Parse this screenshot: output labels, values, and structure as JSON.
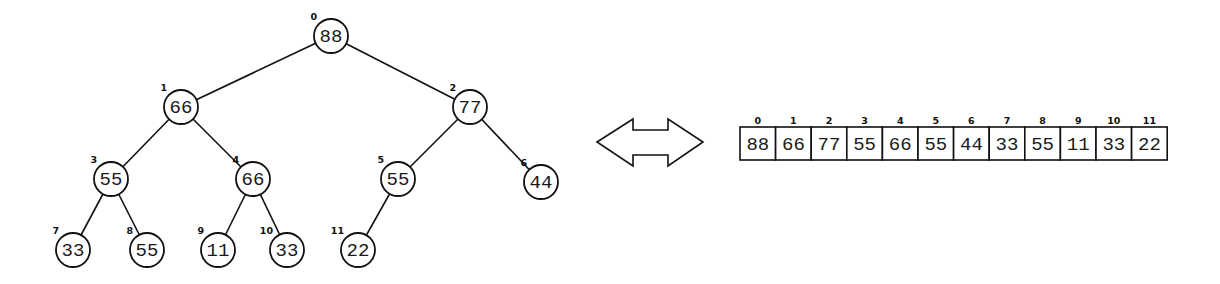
{
  "diagram": {
    "type": "max-heap tree-to-array equivalence",
    "colors": {
      "stroke": "#111111",
      "fill": "#ffffff",
      "text": "#1a1a1a"
    },
    "tree": {
      "node_radius": 17,
      "nodes": [
        {
          "index": "0",
          "value": "88",
          "x": 331,
          "y": 36
        },
        {
          "index": "1",
          "value": "66",
          "x": 181,
          "y": 107
        },
        {
          "index": "2",
          "value": "77",
          "x": 470,
          "y": 107
        },
        {
          "index": "3",
          "value": "55",
          "x": 111,
          "y": 179
        },
        {
          "index": "4",
          "value": "66",
          "x": 253,
          "y": 179
        },
        {
          "index": "5",
          "value": "55",
          "x": 398,
          "y": 179
        },
        {
          "index": "6",
          "value": "44",
          "x": 541,
          "y": 182
        },
        {
          "index": "7",
          "value": "33",
          "x": 73,
          "y": 250
        },
        {
          "index": "8",
          "value": "55",
          "x": 147,
          "y": 250
        },
        {
          "index": "9",
          "value": "11",
          "x": 218,
          "y": 250
        },
        {
          "index": "10",
          "value": "33",
          "x": 287,
          "y": 250
        },
        {
          "index": "11",
          "value": "22",
          "x": 358,
          "y": 250
        }
      ],
      "edges": [
        [
          0,
          1
        ],
        [
          0,
          2
        ],
        [
          1,
          3
        ],
        [
          1,
          4
        ],
        [
          2,
          5
        ],
        [
          2,
          6
        ],
        [
          3,
          7
        ],
        [
          3,
          8
        ],
        [
          4,
          9
        ],
        [
          4,
          10
        ],
        [
          5,
          11
        ]
      ]
    },
    "arrow": {
      "icon": "double-headed-arrow-icon",
      "points": "597,142 633,119 633,130 668,130 668,119 703,142 668,166 668,155 633,155 633,166"
    },
    "array": {
      "x": 740,
      "y": 127,
      "cell_width": 35.6,
      "cell_height": 33,
      "cells": [
        {
          "index": "0",
          "value": "88"
        },
        {
          "index": "1",
          "value": "66"
        },
        {
          "index": "2",
          "value": "77"
        },
        {
          "index": "3",
          "value": "55"
        },
        {
          "index": "4",
          "value": "66"
        },
        {
          "index": "5",
          "value": "55"
        },
        {
          "index": "6",
          "value": "44"
        },
        {
          "index": "7",
          "value": "33"
        },
        {
          "index": "8",
          "value": "55"
        },
        {
          "index": "9",
          "value": "11"
        },
        {
          "index": "10",
          "value": "33"
        },
        {
          "index": "11",
          "value": "22"
        }
      ]
    }
  }
}
